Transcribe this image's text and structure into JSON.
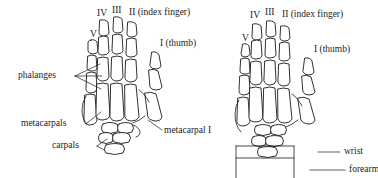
{
  "figure": {
    "ink_color": "#1a1a1a",
    "background_color": "#ffffff"
  },
  "left_panel": {
    "name": "palmar-hand-skeleton",
    "digit_labels": {
      "digit_v": "V",
      "digit_iv": "IV",
      "digit_iii": "III",
      "digit_ii": "II (index finger)",
      "digit_i": "I (thumb)"
    },
    "part_labels": {
      "phalanges": "phalanges",
      "metacarpals": "metacarpals",
      "carpals": "carpals",
      "metacarpal_i": "metacarpal I"
    }
  },
  "right_panel": {
    "name": "dorsal-hand-skeleton",
    "digit_labels": {
      "digit_v": "V",
      "digit_iv": "IV",
      "digit_iii": "III",
      "digit_ii": "II (index finger)",
      "digit_i": "I (thumb)"
    },
    "part_labels": {
      "wrist": "wrist",
      "forearm": "forearm"
    }
  }
}
